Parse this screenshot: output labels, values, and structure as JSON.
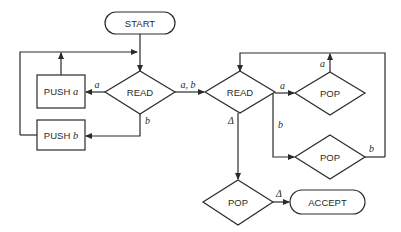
{
  "diagram": {
    "type": "flowchart",
    "nodes": {
      "start": {
        "label": "START",
        "shape": "rounded-rect"
      },
      "read1": {
        "label": "READ",
        "shape": "diamond"
      },
      "push_a": {
        "label": "PUSH ",
        "var": "a",
        "shape": "rect"
      },
      "push_b": {
        "label": "PUSH ",
        "var": "b",
        "shape": "rect"
      },
      "read2": {
        "label": "READ",
        "shape": "diamond"
      },
      "pop1": {
        "label": "POP",
        "shape": "diamond"
      },
      "pop2": {
        "label": "POP",
        "shape": "diamond"
      },
      "pop3": {
        "label": "POP",
        "shape": "diamond"
      },
      "accept": {
        "label": "ACCEPT",
        "shape": "rounded-rect"
      }
    },
    "edges": {
      "read1_to_push_a": "a",
      "read1_to_push_b": "b",
      "read1_to_read2": "a, b",
      "read2_to_pop1": "a",
      "read2_to_pop2": "b",
      "read2_to_pop3": "Δ",
      "pop1_to_read2": "a",
      "pop2_to_read2": "b",
      "pop3_to_accept": "Δ"
    },
    "colors": {
      "stroke": "#2a2a2a",
      "background": "#ffffff"
    }
  }
}
